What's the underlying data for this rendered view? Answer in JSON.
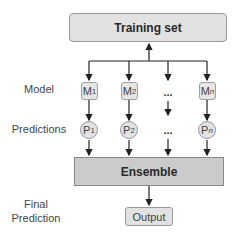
{
  "training_set": {
    "label": "Training set"
  },
  "row_labels": {
    "model": "Model",
    "predictions": "Predictions",
    "final_line1": "Final",
    "final_line2": "Prediction"
  },
  "models": [
    {
      "base": "M",
      "sub": "1"
    },
    {
      "base": "M",
      "sub": "2"
    },
    {
      "base": "...",
      "sub": ""
    },
    {
      "base": "M",
      "sub": "n"
    }
  ],
  "predictions": [
    {
      "base": "P",
      "sub": "1"
    },
    {
      "base": "P",
      "sub": "2"
    },
    {
      "base": "...",
      "sub": ""
    },
    {
      "base": "P",
      "sub": "n"
    }
  ],
  "ensemble": {
    "label": "Ensemble"
  },
  "output": {
    "label": "Output"
  },
  "colors": {
    "box_fill": "#e2e2e2",
    "ensemble_fill": "#cbcbcb",
    "border": "#999999",
    "arrow": "#222222"
  }
}
